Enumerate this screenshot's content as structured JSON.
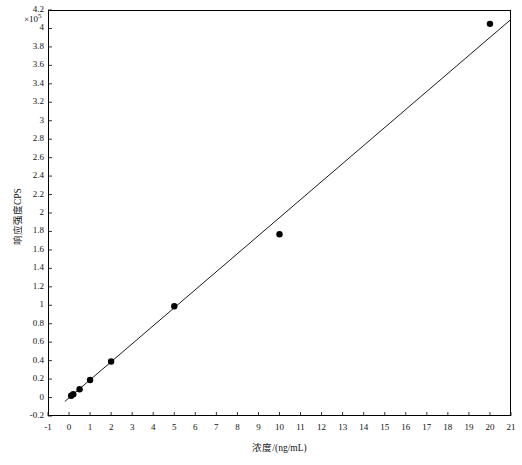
{
  "chart_data": {
    "type": "scatter",
    "title": "",
    "xlabel": "浓度/(ng/mL)",
    "ylabel": "响应强度CPS",
    "y_multiplier": "×10",
    "y_multiplier_exp": "5",
    "xlim": [
      -1,
      21
    ],
    "ylim": [
      -0.2,
      4.2
    ],
    "xticks": [
      -1,
      0,
      1,
      2,
      3,
      4,
      5,
      6,
      7,
      8,
      9,
      10,
      11,
      12,
      13,
      14,
      15,
      16,
      17,
      18,
      19,
      20,
      21
    ],
    "xtick_labels": [
      "-1",
      "0",
      "1",
      "2",
      "3",
      "4",
      "5",
      "6",
      "7",
      "8",
      "9",
      "10",
      "11",
      "12",
      "13",
      "14",
      "15",
      "16",
      "17",
      "18",
      "19",
      "20",
      "21"
    ],
    "yticks": [
      -0.2,
      0,
      0.2,
      0.4,
      0.6,
      0.8,
      1,
      1.2,
      1.4,
      1.6,
      1.8,
      2,
      2.2,
      2.4,
      2.6,
      2.8,
      3,
      3.2,
      3.4,
      3.6,
      3.8,
      4,
      4.2
    ],
    "ytick_labels": [
      "-0.2",
      "0",
      "0.2",
      "0.4",
      "0.6",
      "0.8",
      "1",
      "1.2",
      "1.4",
      "1.6",
      "1.8",
      "2",
      "2.2",
      "2.4",
      "2.6",
      "2.8",
      "3",
      "3.2",
      "3.4",
      "3.6",
      "3.8",
      "4",
      "4.2"
    ],
    "grid": false,
    "legend": "none",
    "series": [
      {
        "name": "calibration-points",
        "marker": "filled-circle",
        "color": "#000000",
        "points": [
          {
            "x": 0.1,
            "y": 0.02
          },
          {
            "x": 0.2,
            "y": 0.035
          },
          {
            "x": 0.5,
            "y": 0.09
          },
          {
            "x": 1.0,
            "y": 0.19
          },
          {
            "x": 2.0,
            "y": 0.39
          },
          {
            "x": 5.0,
            "y": 0.99
          },
          {
            "x": 10.0,
            "y": 1.77
          },
          {
            "x": 20.0,
            "y": 4.05
          }
        ]
      },
      {
        "name": "regression-line",
        "marker": "none",
        "color": "#000000",
        "slope": 19532.165175,
        "intercept": -325.59313,
        "x_range": [
          -0.2,
          21
        ]
      }
    ],
    "annotations": {
      "equation_y": "y",
      "equation_rest": " = 19532.165175x − 325.593130",
      "r2_symbol": "R",
      "r2_exp": "2",
      "r2_value": " = 0.996"
    }
  },
  "figure": {
    "background": "#ffffff",
    "axis_color": "#000000",
    "marker_color": "#000000",
    "line_color": "#000000"
  }
}
